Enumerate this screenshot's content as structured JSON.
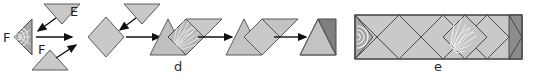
{
  "figure": {
    "type": "diagram",
    "background_color": "#ffffff",
    "panels": [
      {
        "id": "d",
        "label": "d",
        "label_position": {
          "x": 174,
          "y": 60
        },
        "description": "Step sequence: triangles fold together into diamonds, then into a parallelogram, then into a final triangle with a dark flap"
      },
      {
        "id": "e",
        "label": "e",
        "label_position": {
          "x": 434,
          "y": 60
        },
        "description": "Final assembled rectangular band showing repeated diamond tiling with a fan motif and dark end caps"
      }
    ],
    "vertex_labels": [
      {
        "text": "F",
        "x": 10,
        "y": 37
      },
      {
        "text": "E",
        "x": 74,
        "y": 25
      },
      {
        "text": "F",
        "x": 43,
        "y": 59
      }
    ],
    "arrows": [
      {
        "name": "arrow-down-left-upper",
        "from": [
          62,
          12
        ],
        "to": [
          38,
          28
        ],
        "direction": "down-left"
      },
      {
        "name": "arrow-up-right-lower",
        "from": [
          52,
          62
        ],
        "to": [
          74,
          46
        ],
        "direction": "up-right"
      },
      {
        "name": "arrow-right-first",
        "from": [
          40,
          37
        ],
        "to": [
          76,
          37
        ],
        "direction": "right"
      },
      {
        "name": "arrow-down-left-second",
        "from": [
          142,
          12
        ],
        "to": [
          120,
          28
        ],
        "direction": "down-left"
      },
      {
        "name": "arrow-right-second",
        "from": [
          114,
          37
        ],
        "to": [
          150,
          37
        ],
        "direction": "right"
      },
      {
        "name": "arrow-right-third",
        "from": [
          196,
          37
        ],
        "to": [
          230,
          37
        ],
        "direction": "right"
      },
      {
        "name": "arrow-right-fourth",
        "from": [
          272,
          37
        ],
        "to": [
          304,
          37
        ],
        "direction": "right"
      }
    ],
    "colors": {
      "fill_light": "#c9c9c9",
      "fill_mid": "#b6b6b6",
      "fill_dark": "#8a8a8a",
      "fill_darkest": "#7a7a7a",
      "stroke": "#555555",
      "stroke_dark": "#3a3a3a",
      "fan_line": "#e4e4e4",
      "arrow": "#101010",
      "text": "#1f1f1f"
    }
  }
}
